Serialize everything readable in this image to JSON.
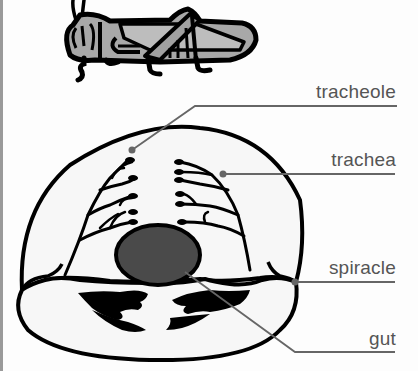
{
  "diagram": {
    "labels": [
      {
        "id": "tracheole",
        "text": "tracheole"
      },
      {
        "id": "trachea",
        "text": "trachea"
      },
      {
        "id": "spiracle",
        "text": "spiracle"
      },
      {
        "id": "gut",
        "text": "gut"
      }
    ],
    "colors": {
      "outline": "#000000",
      "body_fill": "#f7f7f7",
      "gut_fill": "#4a4a4a",
      "grasshopper_fill": "#a8a8a8",
      "leader_line": "#666666",
      "label_text": "#555555",
      "left_border": "#9a9a9a"
    }
  }
}
